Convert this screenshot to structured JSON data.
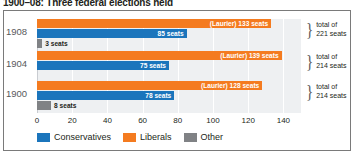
{
  "title": "1900–08: Three federal elections held",
  "colors": {
    "conservatives": "#1b75bc",
    "liberals": "#f47b20",
    "other": "#808285",
    "plot_background": "#eef0f2",
    "frame": "#7a7a7a",
    "year_text": "#58595b"
  },
  "legend": {
    "position": "bottom-left",
    "items": [
      {
        "label": "Conservatives",
        "color": "#1b75bc",
        "icon": "legend-swatch"
      },
      {
        "label": "Liberals",
        "color": "#f47b20",
        "icon": "legend-swatch"
      },
      {
        "label": "Other",
        "color": "#808285",
        "icon": "legend-swatch"
      }
    ]
  },
  "axis": {
    "ticks": [
      "0",
      "20",
      "40",
      "60",
      "80",
      "100",
      "120",
      "140"
    ],
    "min": 0,
    "max": 150
  },
  "rows": [
    {
      "year": "1908",
      "total_line1": "total of",
      "total_line2": "221 seats",
      "brace": "}",
      "bars": [
        {
          "series": "Liberals",
          "value": 133,
          "label": "(Laurier) 133 seats"
        },
        {
          "series": "Conservatives",
          "value": 85,
          "label": "85 seats"
        },
        {
          "series": "Other",
          "value": 3,
          "label": "3 seats"
        }
      ]
    },
    {
      "year": "1904",
      "total_line1": "total of",
      "total_line2": "214 seats",
      "brace": "}",
      "bars": [
        {
          "series": "Liberals",
          "value": 139,
          "label": "(Laurier) 139 seats"
        },
        {
          "series": "Conservatives",
          "value": 75,
          "label": "75 seats"
        },
        {
          "series": "Other",
          "value": 0,
          "label": ""
        }
      ]
    },
    {
      "year": "1900",
      "total_line1": "total of",
      "total_line2": "214 seats",
      "brace": "}",
      "bars": [
        {
          "series": "Liberals",
          "value": 128,
          "label": "(Laurier) 128 seats"
        },
        {
          "series": "Conservatives",
          "value": 78,
          "label": "78 seats"
        },
        {
          "series": "Other",
          "value": 8,
          "label": "8 seats"
        }
      ]
    }
  ],
  "chart_data": {
    "type": "bar",
    "orientation": "horizontal",
    "title": "1900–08: Three federal elections held",
    "xlabel": "",
    "ylabel": "",
    "categories": [
      "1908",
      "1904",
      "1900"
    ],
    "series": [
      {
        "name": "Liberals",
        "color": "#f47b20",
        "values": [
          133,
          139,
          128
        ]
      },
      {
        "name": "Conservatives",
        "color": "#1b75bc",
        "values": [
          85,
          75,
          78
        ]
      },
      {
        "name": "Other",
        "color": "#808285",
        "values": [
          3,
          0,
          8
        ]
      }
    ],
    "data_labels": {
      "1908": [
        "(Laurier) 133 seats",
        "85 seats",
        "3 seats"
      ],
      "1904": [
        "(Laurier) 139 seats",
        "75 seats",
        ""
      ],
      "1900": [
        "(Laurier) 128 seats",
        "78 seats",
        "8 seats"
      ]
    },
    "annotations": [
      {
        "category": "1908",
        "text": "total of 221 seats"
      },
      {
        "category": "1904",
        "text": "total of 214 seats"
      },
      {
        "category": "1900",
        "text": "total of 214 seats"
      }
    ],
    "xlim": [
      0,
      150
    ],
    "xticks": [
      0,
      20,
      40,
      60,
      80,
      100,
      120,
      140
    ],
    "grid": true,
    "legend_position": "bottom-left"
  }
}
